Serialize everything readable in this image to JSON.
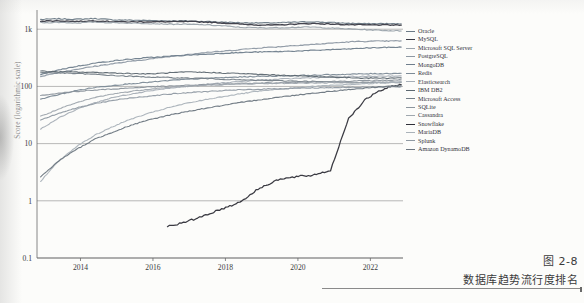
{
  "caption": {
    "figure_number": "图 2-8",
    "title": "数据库趋势流行度排名"
  },
  "chart_data": {
    "type": "line",
    "title": "",
    "xlabel": "",
    "ylabel": "Score (logarithmic scale)",
    "grid": true,
    "legend_position": "right",
    "xlim": [
      2012.8,
      2022.9
    ],
    "ylim": [
      0.1,
      2000
    ],
    "yscale": "log",
    "xticks": [
      2014,
      2016,
      2018,
      2020,
      2022
    ],
    "xticklabels": [
      "2014",
      "2016",
      "2018",
      "2020",
      "2022"
    ],
    "yticks": [
      0.1,
      1,
      10,
      100,
      1000
    ],
    "yticklabels": [
      "0.1",
      "1",
      "10",
      "100",
      "1k"
    ],
    "x": [
      2012.9,
      2013.4,
      2013.9,
      2014.4,
      2014.9,
      2015.4,
      2015.9,
      2016.4,
      2016.9,
      2017.4,
      2017.9,
      2018.4,
      2018.9,
      2019.4,
      2019.9,
      2020.4,
      2020.9,
      2021.4,
      2021.9,
      2022.4,
      2022.85
    ],
    "series": [
      {
        "name": "Oracle",
        "color": "#6b7a86",
        "width": 1.15,
        "values": [
          1480,
          1520,
          1490,
          1540,
          1460,
          1440,
          1420,
          1400,
          1390,
          1370,
          1330,
          1300,
          1290,
          1290,
          1330,
          1350,
          1310,
          1270,
          1250,
          1250,
          1240
        ]
      },
      {
        "name": "MySQL",
        "color": "#3b3b46",
        "width": 1.35,
        "values": [
          1390,
          1400,
          1370,
          1400,
          1360,
          1340,
          1350,
          1350,
          1360,
          1340,
          1290,
          1230,
          1190,
          1180,
          1230,
          1260,
          1230,
          1200,
          1190,
          1190,
          1180
        ]
      },
      {
        "name": "Microsoft SQL Server",
        "color": "#9aa3ab",
        "width": 1.15,
        "values": [
          1300,
          1320,
          1290,
          1330,
          1300,
          1280,
          1260,
          1230,
          1220,
          1200,
          1150,
          1080,
          1060,
          1060,
          1080,
          1090,
          1050,
          1010,
          980,
          950,
          930
        ]
      },
      {
        "name": "PostgreSQL",
        "color": "#8d98a3",
        "width": 1.15,
        "values": [
          150,
          175,
          200,
          225,
          250,
          275,
          300,
          330,
          360,
          390,
          410,
          440,
          470,
          490,
          520,
          540,
          570,
          600,
          615,
          620,
          625
        ]
      },
      {
        "name": "MongoDB",
        "color": "#6f7e8c",
        "width": 1.15,
        "values": [
          160,
          195,
          225,
          255,
          280,
          300,
          320,
          335,
          350,
          365,
          380,
          390,
          400,
          405,
          415,
          425,
          440,
          450,
          470,
          480,
          485
        ]
      },
      {
        "name": "Redis",
        "color": "#7d8b97",
        "width": 1.15,
        "values": [
          60,
          72,
          85,
          96,
          104,
          112,
          118,
          126,
          133,
          138,
          142,
          146,
          150,
          152,
          155,
          157,
          160,
          163,
          166,
          168,
          170
        ]
      },
      {
        "name": "Elasticsearch",
        "color": "#a6aeb6",
        "width": 1.1,
        "values": [
          18,
          28,
          40,
          52,
          64,
          74,
          84,
          92,
          100,
          108,
          115,
          122,
          128,
          133,
          138,
          142,
          145,
          148,
          150,
          152,
          153
        ]
      },
      {
        "name": "IBM DB2",
        "color": "#5c6770",
        "width": 1.1,
        "values": [
          185,
          180,
          178,
          176,
          172,
          168,
          165,
          172,
          178,
          176,
          172,
          168,
          162,
          158,
          154,
          150,
          146,
          142,
          140,
          140,
          141
        ]
      },
      {
        "name": "Microsoft Access",
        "color": "#737d86",
        "width": 1.1,
        "values": [
          175,
          172,
          168,
          162,
          155,
          150,
          146,
          143,
          140,
          138,
          134,
          130,
          128,
          126,
          124,
          122,
          120,
          118,
          117,
          117,
          118
        ]
      },
      {
        "name": "SQLite",
        "color": "#8b949c",
        "width": 1.1,
        "values": [
          70,
          76,
          82,
          86,
          90,
          94,
          98,
          101,
          104,
          107,
          110,
          112,
          114,
          116,
          118,
          120,
          122,
          124,
          126,
          128,
          130
        ]
      },
      {
        "name": "Cassandra",
        "color": "#9fa7ae",
        "width": 1.1,
        "values": [
          30,
          40,
          52,
          64,
          74,
          82,
          90,
          96,
          100,
          104,
          107,
          110,
          112,
          113,
          114,
          115,
          116,
          117,
          118,
          119,
          120
        ]
      },
      {
        "name": "Snowflake",
        "color": "#2f2f38",
        "width": 1.25,
        "values": [
          null,
          null,
          null,
          null,
          null,
          null,
          null,
          0.36,
          0.42,
          0.55,
          0.72,
          0.95,
          1.6,
          2.3,
          2.6,
          2.8,
          3.4,
          28,
          62,
          92,
          108
        ]
      },
      {
        "name": "MariaDB",
        "color": "#aab2b9",
        "width": 1.1,
        "values": [
          2.2,
          5,
          9,
          14,
          20,
          27,
          34,
          42,
          50,
          58,
          66,
          74,
          82,
          88,
          94,
          100,
          104,
          108,
          112,
          116,
          120
        ]
      },
      {
        "name": "Splunk",
        "color": "#8f99a2",
        "width": 1.1,
        "values": [
          26,
          34,
          42,
          50,
          57,
          63,
          68,
          73,
          77,
          81,
          84,
          87,
          89,
          91,
          93,
          94,
          95,
          96,
          97,
          98,
          99
        ]
      },
      {
        "name": "Amazon DynamoDB",
        "color": "#6c7680",
        "width": 1.1,
        "values": [
          2.6,
          5,
          8,
          12,
          16,
          21,
          26,
          31,
          36,
          41,
          46,
          52,
          58,
          64,
          70,
          76,
          82,
          88,
          94,
          100,
          104
        ]
      }
    ]
  }
}
